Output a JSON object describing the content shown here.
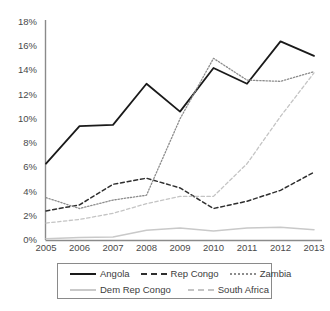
{
  "chart_data": {
    "type": "line",
    "title": "",
    "subtitle": "",
    "xlabel": "",
    "ylabel": "",
    "x": [
      2005,
      2006,
      2007,
      2008,
      2009,
      2010,
      2011,
      2012,
      2013
    ],
    "categories": [
      "2005",
      "2006",
      "2007",
      "2008",
      "2009",
      "2010",
      "2011",
      "2012",
      "2013"
    ],
    "ylim": [
      0,
      18
    ],
    "ytick_values": [
      0,
      2,
      4,
      6,
      8,
      10,
      12,
      14,
      16,
      18
    ],
    "ytick_labels": [
      "0%",
      "2%",
      "4%",
      "6%",
      "8%",
      "10%",
      "12%",
      "14%",
      "16%",
      "18%"
    ],
    "grid": false,
    "legend_position": "bottom",
    "series": [
      {
        "name": "Angola",
        "style": "solid",
        "color": "#1a1a1a",
        "width": 1.8,
        "values": [
          6.3,
          9.4,
          9.5,
          12.9,
          10.6,
          14.2,
          12.9,
          16.4,
          15.2
        ]
      },
      {
        "name": "Rep Congo",
        "style": "dashed",
        "color": "#2e2e2e",
        "width": 1.5,
        "values": [
          2.4,
          2.9,
          4.6,
          5.1,
          4.3,
          2.6,
          3.2,
          4.1,
          5.6
        ]
      },
      {
        "name": "Zambia",
        "style": "dotted",
        "color": "#8c8c8c",
        "width": 1.3,
        "values": [
          3.5,
          2.6,
          3.3,
          3.7,
          10.0,
          15.0,
          13.2,
          13.1,
          13.9
        ]
      },
      {
        "name": "Dem Rep Congo",
        "style": "solid",
        "color": "#c9c9c9",
        "width": 1.5,
        "values": [
          0.1,
          0.2,
          0.25,
          0.8,
          1.0,
          0.75,
          1.0,
          1.05,
          0.85
        ]
      },
      {
        "name": "South Africa",
        "style": "dashed",
        "color": "#c4c4c4",
        "width": 1.3,
        "values": [
          1.4,
          1.7,
          2.2,
          3.0,
          3.6,
          3.6,
          6.3,
          10.2,
          13.8
        ]
      }
    ]
  },
  "legend": {
    "items": [
      {
        "label": "Angola"
      },
      {
        "label": "Rep Congo"
      },
      {
        "label": "Zambia"
      },
      {
        "label": "Dem Rep Congo"
      },
      {
        "label": "South Africa"
      }
    ]
  }
}
